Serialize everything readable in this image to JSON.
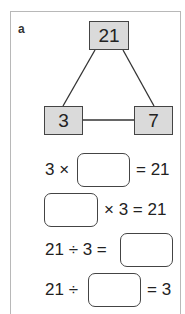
{
  "exercise": {
    "label": "a",
    "triangle": {
      "top": "21",
      "left": "3",
      "right": "7"
    },
    "equations": [
      {
        "before": "3 ×",
        "after": "= 21",
        "answer": ""
      },
      {
        "before": "",
        "after": "× 3 = 21",
        "answer": ""
      },
      {
        "before": "21 ÷ 3 =",
        "after": "",
        "answer": ""
      },
      {
        "before": "21 ÷",
        "after": "= 3",
        "answer": ""
      }
    ]
  },
  "colors": {
    "node_fill": "#dadada",
    "line": "#444444",
    "frame": "#b8b8b8"
  }
}
